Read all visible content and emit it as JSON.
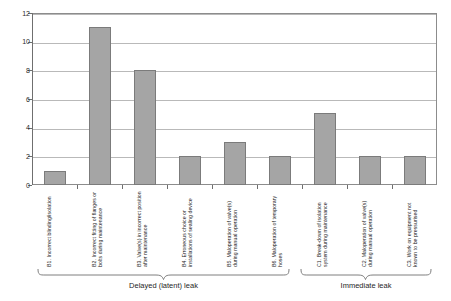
{
  "chart_data": {
    "type": "bar",
    "title": "",
    "xlabel": "",
    "ylabel": "",
    "ylim": [
      0,
      12
    ],
    "grid": true,
    "legend": "none",
    "categories": [
      "B1. Incorrect blinding/isolation",
      "B2. Incorrect fitting of flanges or bolts during maintenance",
      "B3. Valve(s) in incorrect position after maintenance",
      "B4. Erroneous choice or installations of sealing device",
      "B5. Maloperation of valve(s) during manual operation",
      "B6. Maloperation of temporary hoses",
      "C1. Break-down of isolation system during maintenance",
      "C2. Maloperation of valve(s) during manual operation",
      "C3. Work on equipment not known to be pressurised"
    ],
    "values": [
      1,
      11,
      8,
      2,
      3,
      2,
      5,
      2,
      2
    ],
    "yticks": [
      0,
      2,
      4,
      6,
      8,
      10,
      12
    ],
    "ytick_labels": [
      "0",
      "2",
      "4",
      "6",
      "8",
      "10",
      "12"
    ],
    "groups": [
      {
        "label": "Delayed (latent) leak",
        "from": 0,
        "to": 5
      },
      {
        "label": "Immediate leak",
        "from": 6,
        "to": 8
      }
    ],
    "colors": {
      "bar_fill": "#a5a5a5",
      "bar_stroke": "#7b7b7b",
      "gridline": "#b9b9b9",
      "axis": "#6f6f6f",
      "text": "#242424"
    }
  }
}
